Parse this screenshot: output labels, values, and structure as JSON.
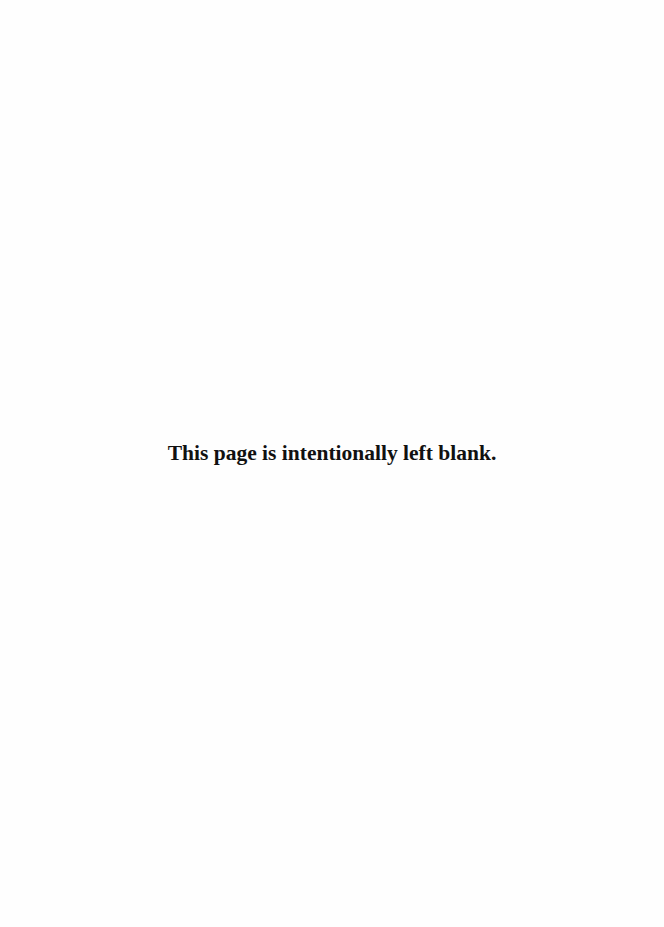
{
  "page": {
    "notice": "This page is intentionally left blank.",
    "background_color": "#fefefe",
    "text_color": "#111111"
  }
}
